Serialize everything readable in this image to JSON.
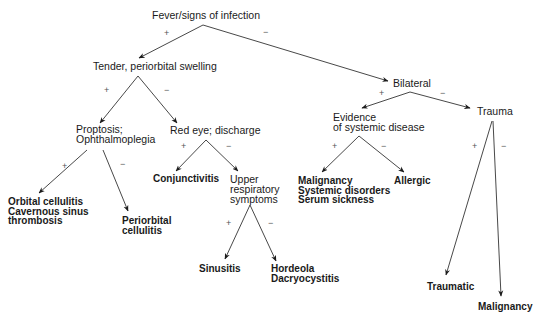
{
  "diagram": {
    "type": "decision-tree",
    "nodes": {
      "root": {
        "lines": [
          "Fever/signs of infection"
        ]
      },
      "tender": {
        "lines": [
          "Tender, periorbital swelling"
        ]
      },
      "bilateral": {
        "lines": [
          "Bilateral"
        ]
      },
      "proptosis": {
        "lines": [
          "Proptosis;",
          "Ophthalmoplegia"
        ]
      },
      "redeye": {
        "lines": [
          "Red eye; discharge"
        ]
      },
      "systemic": {
        "lines": [
          "Evidence",
          "of systemic disease"
        ]
      },
      "trauma": {
        "lines": [
          "Trauma"
        ]
      },
      "orbital": {
        "lines": [
          "Orbital cellulitis",
          "Cavernous sinus",
          "thrombosis"
        ]
      },
      "periorbital": {
        "lines": [
          "Periorbital",
          "cellulitis"
        ]
      },
      "conjunctivitis": {
        "lines": [
          "Conjunctivitis"
        ]
      },
      "uri": {
        "lines": [
          "Upper",
          "respiratory",
          "symptoms"
        ]
      },
      "malignancy_sys": {
        "lines": [
          "Malignancy",
          "Systemic disorders",
          "Serum sickness"
        ]
      },
      "allergic": {
        "lines": [
          "Allergic"
        ]
      },
      "sinusitis": {
        "lines": [
          "Sinusitis"
        ]
      },
      "hordeola": {
        "lines": [
          "Hordeola",
          "Dacryocystitis"
        ]
      },
      "traumatic": {
        "lines": [
          "Traumatic"
        ]
      },
      "malignancy_tr": {
        "lines": [
          "Malignancy"
        ]
      }
    },
    "signs": {
      "plus": "+",
      "minus": "−"
    },
    "edges": [
      {
        "from": "Fever/signs of infection",
        "to": "Tender, periorbital swelling",
        "label": "+"
      },
      {
        "from": "Fever/signs of infection",
        "to": "Bilateral",
        "label": "−"
      },
      {
        "from": "Tender, periorbital swelling",
        "to": "Proptosis; Ophthalmoplegia",
        "label": "+"
      },
      {
        "from": "Tender, periorbital swelling",
        "to": "Red eye; discharge",
        "label": "−"
      },
      {
        "from": "Proptosis; Ophthalmoplegia",
        "to": "Orbital cellulitis / Cavernous sinus thrombosis",
        "label": "+"
      },
      {
        "from": "Proptosis; Ophthalmoplegia",
        "to": "Periorbital cellulitis",
        "label": "−"
      },
      {
        "from": "Red eye; discharge",
        "to": "Conjunctivitis",
        "label": "+"
      },
      {
        "from": "Red eye; discharge",
        "to": "Upper respiratory symptoms",
        "label": "−"
      },
      {
        "from": "Upper respiratory symptoms",
        "to": "Sinusitis",
        "label": "+"
      },
      {
        "from": "Upper respiratory symptoms",
        "to": "Hordeola / Dacryocystitis",
        "label": "−"
      },
      {
        "from": "Bilateral",
        "to": "Evidence of systemic disease",
        "label": "+"
      },
      {
        "from": "Bilateral",
        "to": "Trauma",
        "label": "−"
      },
      {
        "from": "Evidence of systemic disease",
        "to": "Malignancy / Systemic disorders / Serum sickness",
        "label": "+"
      },
      {
        "from": "Evidence of systemic disease",
        "to": "Allergic",
        "label": "−"
      },
      {
        "from": "Trauma",
        "to": "Traumatic",
        "label": "+"
      },
      {
        "from": "Trauma",
        "to": "Malignancy",
        "label": "−"
      }
    ]
  }
}
